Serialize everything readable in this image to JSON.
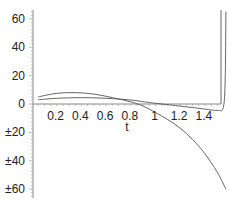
{
  "chart_data": {
    "type": "line",
    "title": "",
    "xlabel": "t",
    "ylabel": "",
    "xlim": [
      0,
      1.57
    ],
    "ylim": [
      -65,
      65
    ],
    "grid": false,
    "legend": null,
    "x_ticks": [
      "0.2",
      "0.4",
      "0.6",
      "0.8",
      "1",
      "1.2",
      "1.4"
    ],
    "y_ticks": [
      "60",
      "40",
      "20",
      "0",
      "±20",
      "±40",
      "±60"
    ],
    "series": [
      {
        "name": "curve-1",
        "x": [
          0.05,
          0.2,
          0.35,
          0.5,
          0.65,
          0.8,
          0.9,
          1.0,
          1.1,
          1.2,
          1.3,
          1.4,
          1.5,
          1.57
        ],
        "y": [
          5,
          7.5,
          8,
          7,
          4.5,
          1.5,
          -1.5,
          -6,
          -11,
          -17,
          -25,
          -35,
          -48,
          -60
        ]
      },
      {
        "name": "curve-2",
        "x": [
          0.05,
          0.2,
          0.4,
          0.6,
          0.8,
          0.95,
          1.05,
          1.2,
          1.35,
          1.5,
          1.55,
          1.565,
          1.57
        ],
        "y": [
          3,
          4,
          4.5,
          4,
          2.8,
          1,
          0,
          -1.5,
          -3,
          -4.5,
          -2,
          20,
          65
        ]
      }
    ],
    "axis_pixel_map": {
      "x0_px": 32,
      "px_per_x": 123.5,
      "y0_px": 104,
      "px_per_y": 1.42
    },
    "line_color": "#555555"
  }
}
